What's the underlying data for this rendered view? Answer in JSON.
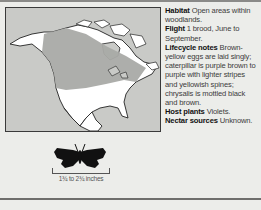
{
  "map": {
    "label": "Range map of North America",
    "range_color": "#a9aaa6",
    "land_color": "#ffffff",
    "water_color": "#c9cac7"
  },
  "details": {
    "habitat": {
      "label": "Habitat",
      "value": "Open areas within woodlands."
    },
    "flight": {
      "label": "Flight",
      "value": "1 brood, June to September."
    },
    "lifecycle": {
      "label": "Lifecycle notes",
      "value": "Brown-yellow eggs are laid singly; caterpillar is purple brown to purple with lighter stripes and yellowish spines; chrysalis is mottled black and brown."
    },
    "host_plants": {
      "label": "Host plants",
      "value": "Violets."
    },
    "nectar_sources": {
      "label": "Nectar sources",
      "value": "Unknown."
    }
  },
  "size": {
    "label": "1¾ to 2¾ inches"
  }
}
